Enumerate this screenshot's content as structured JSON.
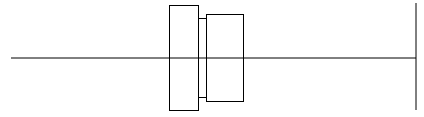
{
  "diagram": {
    "stroke_color": "#000000",
    "background": "#ffffff",
    "axis_line": {
      "x1": 11,
      "y1": 58,
      "x2": 416,
      "y2": 58
    },
    "end_line": {
      "x1": 416,
      "y1": 3,
      "x2": 416,
      "y2": 110
    },
    "left_box": {
      "x": 169.5,
      "y": 5.5,
      "width": 29,
      "height": 105
    },
    "right_box": {
      "x": 206.5,
      "y": 14.5,
      "width": 37,
      "height": 87
    },
    "connector_top": {
      "x1": 198.5,
      "y1": 18.5,
      "x2": 206.5,
      "y2": 18.5
    },
    "connector_bottom": {
      "x1": 198.5,
      "y1": 97.5,
      "x2": 206.5,
      "y2": 97.5
    },
    "connector_vertical": {
      "x1": 202.5,
      "y1": 18.5,
      "x2": 202.5,
      "y2": 97.5
    }
  }
}
